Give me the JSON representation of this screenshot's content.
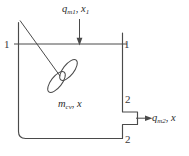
{
  "figure": {
    "stroke_color": "#4a4a4a",
    "text_color": "#2b2b2b",
    "background": "#ffffff"
  },
  "labels": {
    "inlet": {
      "symbol": "q",
      "subscript": "m1",
      "separator": ", ",
      "symbol2": "x",
      "subscript2": "1",
      "name": "inlet-stream-label"
    },
    "control_volume": {
      "symbol": "m",
      "subscript": "cv",
      "separator": ", ",
      "symbol2": "x",
      "subscript2": "",
      "name": "control-volume-label"
    },
    "outlet": {
      "symbol": "q",
      "subscript": "m2",
      "separator": ", ",
      "symbol2": "x",
      "subscript2": "",
      "name": "outlet-stream-label"
    },
    "sections": {
      "one_left": "1",
      "one_right": "1",
      "two_upper": "2",
      "two_lower": "2"
    }
  },
  "elements": {
    "tank": "tank-vessel-outline",
    "stirrer": "stirrer-propeller",
    "shaft": "stirrer-shaft",
    "inlet_arrow": "inlet-flow-arrow",
    "outlet_arrow": "outlet-flow-arrow",
    "surface_line": "liquid-surface-section-line",
    "outlet_spout": "outlet-spout"
  }
}
